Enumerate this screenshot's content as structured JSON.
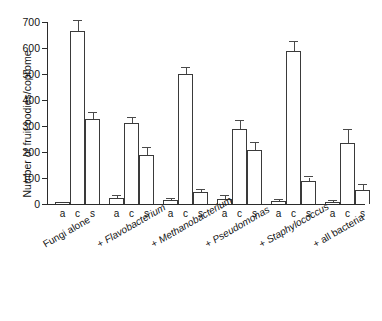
{
  "chart_data": {
    "type": "bar",
    "title": "",
    "xlabel": "",
    "ylabel": "Number of fruit bodies/coprome",
    "ylim": [
      0,
      700
    ],
    "yticks": [
      0,
      100,
      200,
      300,
      400,
      500,
      600,
      700
    ],
    "grid": false,
    "legend": "none",
    "subcategory_labels": [
      "a",
      "c",
      "s"
    ],
    "categories": [
      "Fungi alone",
      "+ Flavobacterium",
      "+ Methanobacterium",
      "+ Pseudomonas",
      "+ Staphylococcus",
      "+ all bacteria"
    ],
    "category_label_parts": [
      {
        "prefix": "Fungi alone",
        "italic": ""
      },
      {
        "prefix": "+ ",
        "italic": "Flavobacterium"
      },
      {
        "prefix": "+ ",
        "italic": "Methanobacterium"
      },
      {
        "prefix": "+ ",
        "italic": "Pseudomonas"
      },
      {
        "prefix": "+ ",
        "italic": "Staphylococcus"
      },
      {
        "prefix": "+ all bacteria",
        "italic": ""
      }
    ],
    "series": [
      {
        "name": "a",
        "values": [
          6,
          22,
          14,
          20,
          10,
          8
        ]
      },
      {
        "name": "c",
        "values": [
          665,
          310,
          500,
          290,
          590,
          235
        ]
      },
      {
        "name": "s",
        "values": [
          328,
          188,
          45,
          208,
          90,
          55
        ]
      }
    ],
    "errors": [
      {
        "name": "a",
        "upper": [
          0,
          10,
          6,
          10,
          4,
          4
        ],
        "lower": [
          0,
          10,
          6,
          10,
          4,
          4
        ]
      },
      {
        "name": "c",
        "upper": [
          38,
          22,
          22,
          28,
          34,
          48
        ],
        "lower": [
          48,
          22,
          22,
          28,
          34,
          48
        ]
      },
      {
        "name": "s",
        "upper": [
          22,
          26,
          10,
          26,
          12,
          18
        ],
        "lower": [
          10,
          26,
          10,
          26,
          12,
          18
        ]
      }
    ]
  },
  "axis": {
    "y_title": "Number of fruit bodies/coprome",
    "tick_labels": [
      "0",
      "100",
      "200",
      "300",
      "400",
      "500",
      "600",
      "700"
    ]
  }
}
